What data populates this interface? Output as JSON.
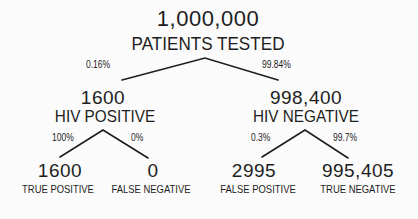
{
  "root": {
    "count": "1,000,000",
    "label": "PATIENTS TESTED"
  },
  "branches": {
    "left_pct": "0.16%",
    "right_pct": "99.84%"
  },
  "hiv_positive": {
    "count": "1600",
    "label": "HIV POSITIVE",
    "left_pct": "100%",
    "right_pct": "0%",
    "true_positive": {
      "count": "1600",
      "label": "TRUE POSITIVE"
    },
    "false_negative": {
      "count": "0",
      "label": "FALSE NEGATIVE"
    }
  },
  "hiv_negative": {
    "count": "998,400",
    "label": "HIV NEGATIVE",
    "left_pct": "0.3%",
    "right_pct": "99.7%",
    "false_positive": {
      "count": "2995",
      "label": "FALSE POSITIVE"
    },
    "true_negative": {
      "count": "995,405",
      "label": "TRUE NEGATIVE"
    }
  },
  "colors": {
    "ink": "#1e1e1e",
    "background": "#fbfbfb"
  }
}
